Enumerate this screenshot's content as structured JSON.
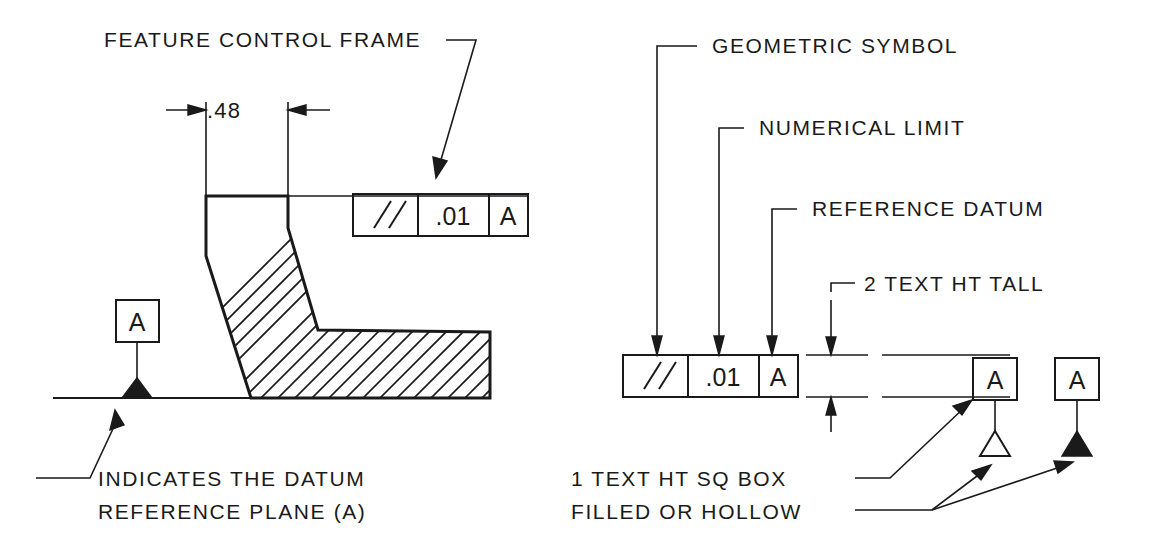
{
  "document": {
    "title": "GD&T Feature Control Frame Annotated Drawing",
    "line_color": "#1a1a1a",
    "background_color": "#ffffff"
  },
  "labels": {
    "feature_control_frame": "FEATURE CONTROL FRAME",
    "geometric_symbol": "GEOMETRIC SYMBOL",
    "numerical_limit": "NUMERICAL LIMIT",
    "reference_datum": "REFERENCE DATUM",
    "two_text_ht_tall": "2 TEXT HT TALL",
    "indicates_datum_line1": "INDICATES THE DATUM",
    "indicates_datum_line2": "REFERENCE PLANE (A)",
    "one_text_ht_sq_box": "1 TEXT HT SQ BOX",
    "filled_or_hollow": "FILLED OR HOLLOW"
  },
  "dimension": {
    "value": ".48"
  },
  "feature_control_frame_left": {
    "geometric_symbol": "//",
    "tolerance": ".01",
    "datum": "A"
  },
  "feature_control_frame_right": {
    "geometric_symbol": "//",
    "tolerance": ".01",
    "datum": "A"
  },
  "datum_symbols": {
    "left_part_datum_letter": "A",
    "hollow_datum_letter": "A",
    "filled_datum_letter": "A"
  }
}
